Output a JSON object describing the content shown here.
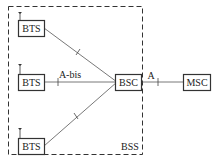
{
  "diagram": {
    "nodes": {
      "bts1": "BTS",
      "bts2": "BTS",
      "bts3": "BTS",
      "bsc": "BSC",
      "msc": "MSC"
    },
    "interfaces": {
      "abis": "A-bis",
      "a": "A"
    },
    "group_label": "BSS",
    "colors": {
      "stroke": "#333333",
      "background": "#ffffff"
    }
  }
}
